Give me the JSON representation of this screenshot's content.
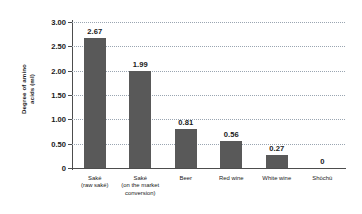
{
  "chart_data": {
    "type": "bar",
    "title": "",
    "xlabel": "",
    "ylabel": "Degree of\namino acids\n(ml)",
    "ylabel_lines": [
      "Degree of",
      "amino acids",
      "(ml)"
    ],
    "ylim": [
      0,
      3.0
    ],
    "ytick_labels": [
      "3.00",
      "2.50",
      "2.00",
      "1.50",
      "1.00",
      "0.50",
      "0"
    ],
    "ytick_values": [
      3.0,
      2.5,
      2.0,
      1.5,
      1.0,
      0.5,
      0
    ],
    "grid": "horizontal-dotted",
    "legend": "none",
    "bar_color": "#595959",
    "categories": [
      "Saké (raw saké)",
      "Saké (on the market conversion)",
      "Beer",
      "Red wine",
      "White wine",
      "Shōchū"
    ],
    "category_label_lines": [
      [
        "Saké",
        "(raw saké)"
      ],
      [
        "Saké",
        "(on the market",
        "conversion)"
      ],
      [
        "Beer"
      ],
      [
        "Red wine"
      ],
      [
        "White wine"
      ],
      [
        "Shōchū"
      ]
    ],
    "values": [
      2.67,
      1.99,
      0.81,
      0.56,
      0.27,
      0
    ],
    "value_labels": [
      "2.67",
      "1.99",
      "0.81",
      "0.56",
      "0.27",
      "0"
    ]
  }
}
